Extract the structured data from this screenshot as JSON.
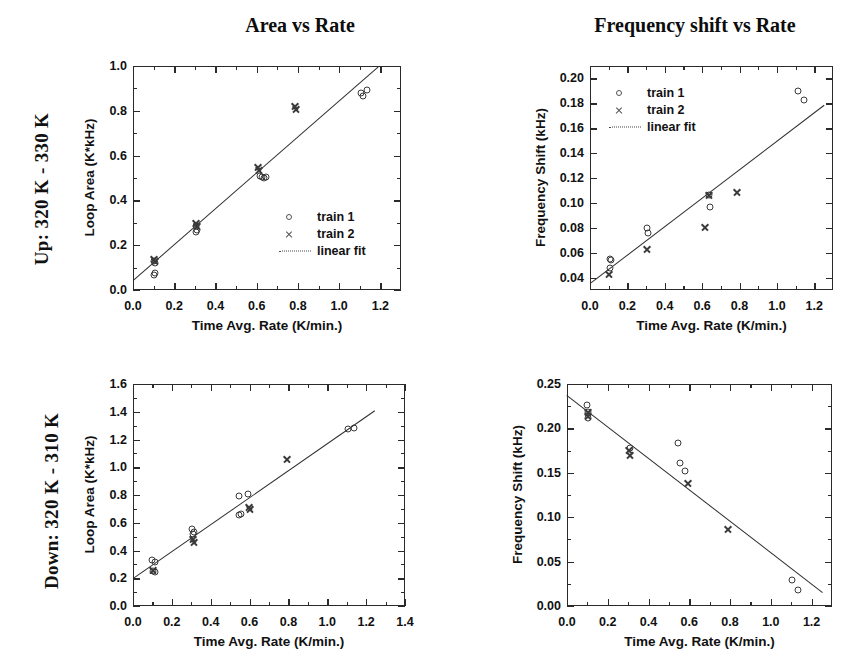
{
  "row_labels": {
    "up": "Up: 320 K - 330 K",
    "down": "Down: 320 K - 310 K"
  },
  "column_titles": {
    "area": "Area vs Rate",
    "freq": "Frequency shift vs Rate"
  },
  "legend": {
    "train1": "train 1",
    "train2": "train 2",
    "fit": "linear fit",
    "icons": {
      "train1": "circle-marker-icon",
      "train2": "cross-marker-icon",
      "fit": "dotted-line-icon"
    }
  },
  "axis_titles": {
    "x": "Time Avg. Rate (K/min.)",
    "y_area": "Loop Area (K*kHz)",
    "y_freq": "Frequency Shift (kHz)"
  },
  "chart_data": [
    {
      "id": "up-area",
      "type": "scatter",
      "title": "Area vs Rate",
      "panel_row_label": "Up: 320 K - 330 K",
      "xlabel": "Time Avg. Rate (K/min.)",
      "ylabel": "Loop Area (K*kHz)",
      "xlim": [
        0.0,
        1.3
      ],
      "ylim": [
        0.0,
        1.0
      ],
      "xticks": [
        0.0,
        0.2,
        0.4,
        0.6,
        0.8,
        1.0,
        1.2
      ],
      "yticks": [
        0.0,
        0.2,
        0.4,
        0.6,
        0.8,
        1.0
      ],
      "xtick_labels": [
        "0.0",
        "0.2",
        "0.4",
        "0.6",
        "0.8",
        "1.0",
        "1.2"
      ],
      "ytick_labels": [
        "0.0",
        "0.2",
        "0.4",
        "0.6",
        "0.8",
        "1.0"
      ],
      "grid": false,
      "legend_position": "lower-right",
      "series": [
        {
          "name": "train 1",
          "marker": "circle",
          "points": [
            [
              0.1,
              0.13
            ],
            [
              0.105,
              0.12
            ],
            [
              0.1,
              0.065
            ],
            [
              0.105,
              0.075
            ],
            [
              0.305,
              0.285
            ],
            [
              0.31,
              0.27
            ],
            [
              0.305,
              0.26
            ],
            [
              0.615,
              0.51
            ],
            [
              0.625,
              0.505
            ],
            [
              0.635,
              0.5
            ],
            [
              0.645,
              0.505
            ],
            [
              1.115,
              0.865
            ],
            [
              1.135,
              0.895
            ],
            [
              1.105,
              0.88
            ]
          ]
        },
        {
          "name": "train 2",
          "marker": "cross",
          "points": [
            [
              0.1,
              0.14
            ],
            [
              0.105,
              0.13
            ],
            [
              0.305,
              0.3
            ],
            [
              0.31,
              0.29
            ],
            [
              0.605,
              0.55
            ],
            [
              0.61,
              0.54
            ],
            [
              0.785,
              0.825
            ],
            [
              0.79,
              0.81
            ]
          ]
        }
      ],
      "fit": {
        "name": "linear fit",
        "x": [
          0.0,
          1.19
        ],
        "y": [
          0.045,
          1.0
        ],
        "slope": 0.8,
        "intercept": 0.045
      }
    },
    {
      "id": "up-freq",
      "type": "scatter",
      "title": "Frequency shift vs Rate",
      "panel_row_label": "Up: 320 K - 330 K",
      "xlabel": "Time Avg. Rate (K/min.)",
      "ylabel": "Frequency Shift (kHz)",
      "xlim": [
        0.0,
        1.3
      ],
      "ylim": [
        0.03,
        0.21
      ],
      "xticks": [
        0.0,
        0.2,
        0.4,
        0.6,
        0.8,
        1.0,
        1.2
      ],
      "yticks": [
        0.04,
        0.06,
        0.08,
        0.1,
        0.12,
        0.14,
        0.16,
        0.18,
        0.2
      ],
      "xtick_labels": [
        "0.0",
        "0.2",
        "0.4",
        "0.6",
        "0.8",
        "1.0",
        "1.2"
      ],
      "ytick_labels": [
        "0.04",
        "0.06",
        "0.08",
        "0.10",
        "0.12",
        "0.14",
        "0.16",
        "0.18",
        "0.20"
      ],
      "grid": false,
      "legend_position": "upper-left",
      "series": [
        {
          "name": "train 1",
          "marker": "circle",
          "points": [
            [
              0.105,
              0.055
            ],
            [
              0.115,
              0.054
            ],
            [
              0.108,
              0.048
            ],
            [
              0.305,
              0.08
            ],
            [
              0.308,
              0.076
            ],
            [
              0.635,
              0.106
            ],
            [
              0.64,
              0.097
            ],
            [
              1.115,
              0.19
            ],
            [
              1.145,
              0.183
            ]
          ]
        },
        {
          "name": "train 2",
          "marker": "cross",
          "points": [
            [
              0.102,
              0.043
            ],
            [
              0.307,
              0.063
            ],
            [
              0.615,
              0.081
            ],
            [
              0.637,
              0.107
            ],
            [
              0.785,
              0.109
            ]
          ]
        }
      ],
      "fit": {
        "name": "linear fit",
        "x": [
          0.0,
          1.25
        ],
        "y": [
          0.036,
          0.179
        ],
        "slope": 0.1144,
        "intercept": 0.036
      }
    },
    {
      "id": "down-area",
      "type": "scatter",
      "title": "Area vs Rate",
      "panel_row_label": "Down: 320 K - 310 K",
      "xlabel": "Time Avg. Rate (K/min.)",
      "ylabel": "Loop Area (K*kHz)",
      "xlim": [
        0.0,
        1.4
      ],
      "ylim": [
        0.0,
        1.6
      ],
      "xticks": [
        0.0,
        0.2,
        0.4,
        0.6,
        0.8,
        1.0,
        1.2,
        1.4
      ],
      "yticks": [
        0.0,
        0.2,
        0.4,
        0.6,
        0.8,
        1.0,
        1.2,
        1.4,
        1.6
      ],
      "xtick_labels": [
        "0.0",
        "0.2",
        "0.4",
        "0.6",
        "0.8",
        "1.0",
        "1.2",
        "1.4"
      ],
      "ytick_labels": [
        "0.0",
        "0.2",
        "0.4",
        "0.6",
        "0.8",
        "1.0",
        "1.2",
        "1.4",
        "1.6"
      ],
      "grid": false,
      "legend_position": "none",
      "series": [
        {
          "name": "train 1",
          "marker": "circle",
          "points": [
            [
              0.098,
              0.335
            ],
            [
              0.112,
              0.32
            ],
            [
              0.104,
              0.255
            ],
            [
              0.112,
              0.245
            ],
            [
              0.305,
              0.555
            ],
            [
              0.312,
              0.535
            ],
            [
              0.308,
              0.52
            ],
            [
              0.545,
              0.79
            ],
            [
              0.592,
              0.81
            ],
            [
              0.545,
              0.655
            ],
            [
              0.558,
              0.66
            ],
            [
              1.105,
              1.275
            ],
            [
              1.135,
              1.285
            ]
          ]
        },
        {
          "name": "train 2",
          "marker": "cross",
          "points": [
            [
              0.105,
              0.265
            ],
            [
              0.308,
              0.49
            ],
            [
              0.315,
              0.465
            ],
            [
              0.595,
              0.715
            ],
            [
              0.6,
              0.705
            ],
            [
              0.795,
              1.06
            ]
          ]
        }
      ],
      "fit": {
        "name": "linear fit",
        "x": [
          0.0,
          1.245
        ],
        "y": [
          0.205,
          1.415
        ],
        "slope": 0.972,
        "intercept": 0.205
      }
    },
    {
      "id": "down-freq",
      "type": "scatter",
      "title": "Frequency shift vs Rate",
      "panel_row_label": "Down: 320 K - 310 K",
      "xlabel": "Time Avg. Rate (K/min.)",
      "ylabel": "Frequency Shift (kHz)",
      "xlim": [
        0.0,
        1.3
      ],
      "ylim": [
        0.0,
        0.25
      ],
      "xticks": [
        0.0,
        0.2,
        0.4,
        0.6,
        0.8,
        1.0,
        1.2
      ],
      "yticks": [
        0.0,
        0.05,
        0.1,
        0.15,
        0.2,
        0.25
      ],
      "xtick_labels": [
        "0.0",
        "0.2",
        "0.4",
        "0.6",
        "0.8",
        "1.0",
        "1.2"
      ],
      "ytick_labels": [
        "0.00",
        "0.05",
        "0.10",
        "0.15",
        "0.20",
        "0.25"
      ],
      "grid": false,
      "legend_position": "none",
      "series": [
        {
          "name": "train 1",
          "marker": "circle",
          "points": [
            [
              0.098,
              0.226
            ],
            [
              0.102,
              0.218
            ],
            [
              0.105,
              0.212
            ],
            [
              0.307,
              0.178
            ],
            [
              0.545,
              0.183
            ],
            [
              0.552,
              0.161
            ],
            [
              0.578,
              0.152
            ],
            [
              1.105,
              0.029
            ],
            [
              1.135,
              0.018
            ]
          ]
        },
        {
          "name": "train 2",
          "marker": "cross",
          "points": [
            [
              0.102,
              0.219
            ],
            [
              0.104,
              0.214
            ],
            [
              0.305,
              0.176
            ],
            [
              0.31,
              0.171
            ],
            [
              0.595,
              0.139
            ],
            [
              0.79,
              0.087
            ]
          ]
        }
      ],
      "fit": {
        "name": "linear fit",
        "x": [
          0.0,
          1.255
        ],
        "y": [
          0.238,
          0.016
        ],
        "slope": -0.1769,
        "intercept": 0.238
      }
    }
  ]
}
